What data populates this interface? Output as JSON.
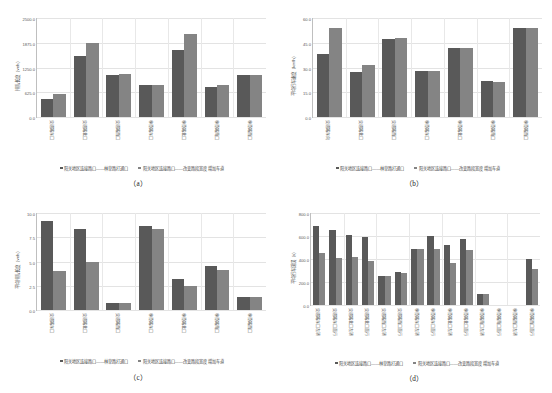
{
  "figure": {
    "series_names": [
      "阳关地区连接路口——林草路打通口",
      "阳关地区连接路口——改变路段宽度 增加车道"
    ],
    "colors": {
      "series1": "#595959",
      "series2": "#848484",
      "grid": "#e3e3e3",
      "axis": "#bfbfbf"
    },
    "captions": {
      "a": "（a）",
      "b": "（b）",
      "c": "（c）",
      "d": "（d）"
    }
  },
  "chart_data": [
    {
      "id": "a",
      "type": "bar",
      "title": "",
      "caption": "（a）",
      "xlabel": "",
      "ylabel": "排队长度（veh）",
      "ylim": [
        0,
        2500
      ],
      "yticks": [
        "0.0",
        "625.0",
        "1250.0",
        "1875.0",
        "2500.0"
      ],
      "ytick_values": [
        0,
        625,
        1250,
        1875,
        2500
      ],
      "grid": true,
      "legend_position": "bottom",
      "categories": [
        "交通路东口",
        "交通路北口",
        "交通路西口",
        "林草路东口",
        "林草路北口",
        "林草路南口",
        "林草路西口"
      ],
      "series": [
        {
          "name": "阳关地区连接路口——林草路打通口",
          "values": [
            460,
            1550,
            1070,
            800,
            1680,
            750,
            1070
          ]
        },
        {
          "name": "阳关地区连接路口——改变路段宽度 增加车道",
          "values": [
            590,
            1880,
            1075,
            810,
            2090,
            800,
            1065
          ]
        }
      ]
    },
    {
      "id": "b",
      "type": "bar",
      "title": "",
      "caption": "（b）",
      "xlabel": "",
      "ylabel": "平均行车速度（km/h）",
      "ylim": [
        0,
        60
      ],
      "yticks": [
        "0.0",
        "15.0",
        "30.0",
        "45.0",
        "60.0"
      ],
      "ytick_values": [
        0,
        15,
        30,
        45,
        60
      ],
      "grid": true,
      "legend_position": "bottom",
      "categories": [
        "交通路东向",
        "交通路北口",
        "交通路西口",
        "林草路东口",
        "林草路北口",
        "林草路南口",
        "林草路西口"
      ],
      "series": [
        {
          "name": "阳关地区连接路口——林草路打通口",
          "values": [
            38.0,
            27.0,
            47.5,
            28.0,
            42.0,
            22.0,
            54.0
          ]
        },
        {
          "name": "阳关地区连接路口——改变路段宽度 增加车道",
          "values": [
            54.0,
            31.5,
            48.0,
            28.0,
            42.0,
            21.0,
            54.0
          ]
        }
      ]
    },
    {
      "id": "c",
      "type": "bar",
      "title": "",
      "caption": "（c）",
      "xlabel": "",
      "ylabel": "平均排队长度（veh）",
      "ylim": [
        0,
        10
      ],
      "yticks": [
        "0.0",
        "2.5",
        "5.0",
        "7.5",
        "10.0"
      ],
      "ytick_values": [
        0,
        2.5,
        5,
        7.5,
        10
      ],
      "grid": true,
      "legend_position": "bottom",
      "categories": [
        "交通路东口",
        "交通路北口",
        "交通路西口",
        "林草路东口",
        "林草路北口",
        "林草路南口",
        "林草路西口"
      ],
      "series": [
        {
          "name": "阳关地区连接路口——林草路打通口",
          "values": [
            9.2,
            8.4,
            0.75,
            8.7,
            3.2,
            4.5,
            1.3
          ]
        },
        {
          "name": "阳关地区连接路口——改变路段宽度 增加车道",
          "values": [
            4.0,
            5.0,
            0.7,
            8.4,
            2.5,
            4.1,
            1.3
          ]
        }
      ]
    },
    {
      "id": "d",
      "type": "bar",
      "title": "",
      "caption": "（d）",
      "xlabel": "",
      "ylabel": "平均行车延误（s）",
      "ylim": [
        0,
        800
      ],
      "yticks": [
        "0.0",
        "200.0",
        "400.0",
        "600.0",
        "800.0"
      ],
      "ytick_values": [
        0,
        200,
        400,
        600,
        800
      ],
      "grid": true,
      "legend_position": "bottom",
      "categories": [
        "交通路东口左转",
        "交通路东口直行",
        "交通路北口左转",
        "交通路北口直行",
        "交通路西口左转",
        "交通路西口直行",
        "林草路东口左转",
        "林草路东口直行",
        "林草路北口左转",
        "林草路北口直行",
        "林草路南口左转",
        "林草路南口直行",
        "林草路西口左转",
        "林草路西口直行"
      ],
      "series": [
        {
          "name": "阳关地区连接路口——林草路打通口",
          "values": [
            690,
            655,
            605,
            590,
            255,
            285,
            490,
            600,
            520,
            570,
            100,
            0,
            0,
            400
          ]
        },
        {
          "name": "阳关地区连接路口——改变路段宽度 增加车道",
          "values": [
            450,
            410,
            415,
            385,
            250,
            275,
            485,
            490,
            365,
            475,
            100,
            0,
            0,
            310
          ]
        }
      ]
    }
  ]
}
